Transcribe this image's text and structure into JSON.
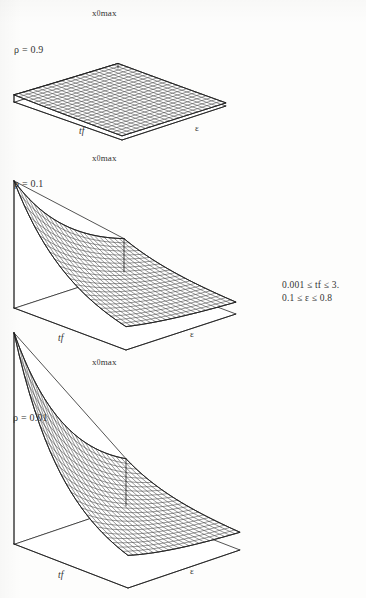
{
  "figure": {
    "type": "three-dimensional-surface-mesh-figure",
    "background_color": "#fdfdfc",
    "line_color": "#1a1a1a",
    "panel_count": 3,
    "range_note": {
      "line1": "0.001 ≤ tf ≤ 3.",
      "line2": "0.1 ≤ ε ≤ 0.8"
    }
  },
  "panels": [
    {
      "id": "panel-rho-0-9",
      "rho_label": "ρ = 0.9",
      "top_label_prefix": "x",
      "top_label_sub": "0",
      "top_label_suffix": "max",
      "top_label_full": "x0max",
      "x_axis_label": "tf",
      "y_axis_label": "ε",
      "surface_description": "nearly flat slab, slight upward curl toward the back corner",
      "height_scale": 0.14
    },
    {
      "id": "panel-rho-0-1",
      "rho_label": "ρ = 0.1",
      "top_label_prefix": "x",
      "top_label_sub": "0",
      "top_label_suffix": "max",
      "top_label_full": "x0max",
      "x_axis_label": "tf",
      "y_axis_label": "ε",
      "surface_description": "concave sheet rising steeply to a peak at the back corner",
      "height_scale": 0.62
    },
    {
      "id": "panel-rho-0-01",
      "rho_label": "ρ = 0.01",
      "top_label_prefix": "x",
      "top_label_sub": "0",
      "top_label_suffix": "max",
      "top_label_full": "x0max",
      "x_axis_label": "tf",
      "y_axis_label": "ε",
      "surface_description": "strongly concave sheet rising to a tall sharp peak at the back corner",
      "height_scale": 0.88
    }
  ],
  "chart_data": {
    "type": "surface",
    "title": "",
    "xlabel": "tf",
    "ylabel": "ε",
    "zlabel": "x0max",
    "xlim": [
      0.001,
      3.0
    ],
    "ylim": [
      0.1,
      0.8
    ],
    "grid": true,
    "legend": "none",
    "annotations": [
      "0.001 ≤ tf ≤ 3.",
      "0.1 ≤ ε ≤ 0.8"
    ],
    "series": [
      {
        "name": "ρ = 0.9",
        "parameter": 0.9,
        "relative_peak_height": 0.14,
        "shape": "flat slab with mild curvature"
      },
      {
        "name": "ρ = 0.1",
        "parameter": 0.1,
        "relative_peak_height": 0.62,
        "shape": "concave sheet peaking at small tf and small ε"
      },
      {
        "name": "ρ = 0.01",
        "parameter": 0.01,
        "relative_peak_height": 0.88,
        "shape": "strongly concave sheet with tall peak at small tf and small ε"
      }
    ],
    "mesh": {
      "nx": 22,
      "ny": 22
    }
  }
}
